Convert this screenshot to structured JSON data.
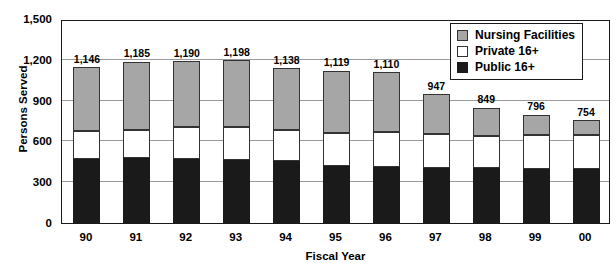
{
  "chart_data": {
    "type": "bar",
    "subtype": "stacked-vertical",
    "title": "",
    "xlabel": "Fiscal Year",
    "ylabel": "Persons Served",
    "ylim": [
      0,
      1500
    ],
    "yticks": [
      "0",
      "300",
      "600",
      "900",
      "1,200",
      "1,500"
    ],
    "ytick_values": [
      0,
      300,
      600,
      900,
      1200,
      1500
    ],
    "grid": true,
    "legend_position": "top-right",
    "categories": [
      "90",
      "91",
      "92",
      "93",
      "94",
      "95",
      "96",
      "97",
      "98",
      "99",
      "00"
    ],
    "series": [
      {
        "name": "Public 16+",
        "color": "#1a1a1a",
        "values": [
          470,
          475,
          468,
          462,
          455,
          420,
          412,
          408,
          405,
          400,
          395
        ]
      },
      {
        "name": "Private 16+",
        "color": "#ffffff",
        "values": [
          208,
          212,
          240,
          245,
          230,
          245,
          258,
          250,
          235,
          245,
          250
        ]
      },
      {
        "name": "Nursing Facilities",
        "color": "#a6a6a6",
        "values": [
          468,
          498,
          482,
          491,
          453,
          454,
          440,
          289,
          209,
          151,
          109
        ]
      }
    ],
    "totals": [
      1146,
      1185,
      1190,
      1198,
      1138,
      1119,
      1110,
      947,
      849,
      796,
      754
    ],
    "total_labels": [
      "1,146",
      "1,185",
      "1,190",
      "1,198",
      "1,138",
      "1,119",
      "1,110",
      "947",
      "849",
      "796",
      "754"
    ]
  },
  "legend": {
    "items": [
      {
        "label": "Nursing Facilities",
        "swatch": "nursing-facilities-swatch"
      },
      {
        "label": "Private 16+",
        "swatch": "private-16-plus-swatch"
      },
      {
        "label": "Public 16+",
        "swatch": "public-16-plus-swatch"
      }
    ]
  },
  "axes": {
    "y_title": "Persons Served",
    "x_title": "Fiscal Year"
  }
}
